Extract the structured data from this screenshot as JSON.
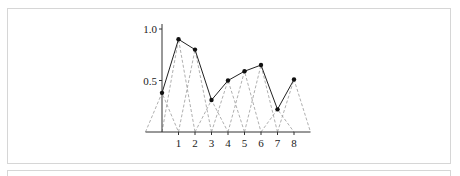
{
  "chart_data": {
    "type": "line",
    "title": "",
    "xlabel": "",
    "ylabel": "",
    "x": [
      0,
      1,
      2,
      3,
      4,
      5,
      6,
      7,
      8
    ],
    "series": [
      {
        "name": "interpolant",
        "style": "solid",
        "marker": "dot",
        "values": [
          0.38,
          0.9,
          0.8,
          0.31,
          0.5,
          0.59,
          0.65,
          0.22,
          0.51
        ]
      },
      {
        "name": "hat basis functions",
        "style": "dashed",
        "note": "each triangle spans [k-1, k+1] with peak value at node k"
      }
    ],
    "xticks": [
      "1",
      "2",
      "3",
      "4",
      "5",
      "6",
      "7",
      "8"
    ],
    "yticks": [
      "0.5",
      "1.0"
    ],
    "xlim": [
      -1,
      9
    ],
    "ylim": [
      0,
      1.05
    ],
    "grid": false,
    "legend": "none"
  },
  "colors": {
    "line": "#222222",
    "dashed": "#9a9a9a",
    "axis": "#333333",
    "panel_border": "#d6d6d6"
  }
}
